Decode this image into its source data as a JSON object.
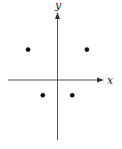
{
  "chart_data": {
    "type": "scatter",
    "title": "",
    "xlabel": "x",
    "ylabel": "y",
    "xlim": [
      -3,
      2.5
    ],
    "ylim": [
      -4,
      4
    ],
    "grid": false,
    "points": [
      {
        "x": -2,
        "y": 2
      },
      {
        "x": 2,
        "y": 2
      },
      {
        "x": -1,
        "y": -1
      },
      {
        "x": 1,
        "y": -1
      }
    ]
  }
}
